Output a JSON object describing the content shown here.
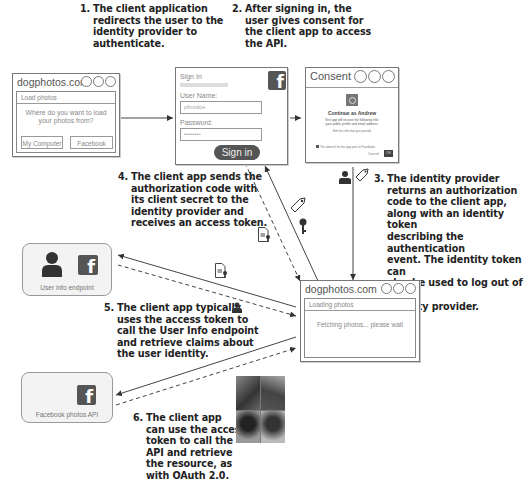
{
  "steps": {
    "s1": {
      "num": "1.",
      "lines": [
        "The client application",
        "redirects the user to the",
        "identity provider to",
        "authenticate."
      ]
    },
    "s2": {
      "num": "2.",
      "lines": [
        "After signing in, the",
        "user gives consent for",
        "the client app to access",
        "the API."
      ]
    },
    "s3": {
      "num": "3.",
      "lines": [
        "The identity provider",
        "returns an authorization",
        "code to the client app,",
        "along with an identity token",
        "describing the authentication",
        "event. The identity token can",
        "also be used to log out of the",
        "identity provider."
      ]
    },
    "s4": {
      "num": "4.",
      "lines": [
        "The client app sends the",
        "authorization code with",
        "its client secret to the",
        "identity provider and",
        "receives an access token."
      ]
    },
    "s5": {
      "num": "5.",
      "lines": [
        "The client app typically",
        "uses the access token to",
        "call the User Info endpoint",
        "and retrieve claims about",
        "the user identity."
      ]
    },
    "s6": {
      "num": "6.",
      "lines": [
        "The client app",
        "can use the access",
        "token to call the",
        "API and retrieve",
        "the resource, as",
        "with OAuth 2.0."
      ]
    }
  },
  "client_window": {
    "title": "dogphotos.com",
    "subtitle": "Load photos",
    "prompt_line1": "Where do you want to load",
    "prompt_line2": "your photos from?",
    "button_computer": "My Computer",
    "button_facebook": "Facebook"
  },
  "signin_window": {
    "heading": "Sign In",
    "username_label": "User Name:",
    "username_value": "pfrnidce",
    "password_label": "Password:",
    "password_value": "••••••••",
    "signin_button": "Sign in",
    "fb_glyph": "f"
  },
  "consent_window": {
    "title": "Consent",
    "continue_text": "Continue as Andrew",
    "desc_line1": "Test app will receive the following info:",
    "desc_line2": "your public profile and email address.",
    "edit_link": "Edit this info that you provide",
    "checkbox_text": "This doesn't let the app post to Facebook.",
    "cancel": "Cancel",
    "ok": "OK"
  },
  "loading_window": {
    "title": "dogphotos.com",
    "subtitle": "Loading photos",
    "message": "Fetching photos... please wait"
  },
  "userinfo_card": {
    "label": "User info endpoint",
    "fb_glyph": "f"
  },
  "fbapi_card": {
    "label": "Facebook photos API",
    "fb_glyph": "f"
  }
}
